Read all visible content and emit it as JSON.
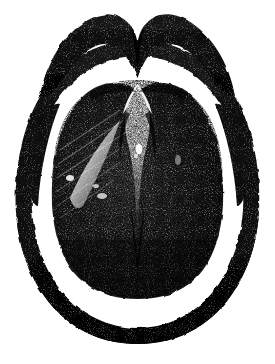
{
  "figure": {
    "kind": "anatomical-engraving",
    "medium": "wood-engraving halftone",
    "alt_text": "Black and white antique engraving of a rounded oval anatomical cross-section with a wavy dark band across the top, a dark outer rim, and a large stippled inner mass split by a central V-shaped groove.",
    "background_color": "#ffffff",
    "ink_color": "#0d0d0d",
    "midtone_color": "#3a3a3a",
    "highlight_color": "#f2f2f2",
    "width_px": 275,
    "height_px": 364
  },
  "parts": [
    {
      "id": "upper-band",
      "label": "Upper wavy band",
      "description": "Dark M-shaped band arching across the top with a central dip and tapering ends.",
      "tone": "dark",
      "bbox": [
        36,
        8,
        240,
        96
      ]
    },
    {
      "id": "outer-rim",
      "label": "Outer rim",
      "description": "Dark oval ring enclosing the figure, thickest along the lower left and lower right.",
      "tone": "dark",
      "bbox": [
        14,
        40,
        262,
        338
      ]
    },
    {
      "id": "left-spur",
      "label": "Left inner spur",
      "description": "Thin tapering sliver inside the left rim, pointed at the upper end.",
      "tone": "dark",
      "bbox": [
        22,
        100,
        66,
        220
      ]
    },
    {
      "id": "right-spur",
      "label": "Right inner spur",
      "description": "Thin tapering sliver inside the right rim, pointed at the upper end, mirroring the left spur.",
      "tone": "dark",
      "bbox": [
        210,
        100,
        254,
        220
      ]
    },
    {
      "id": "inner-mass",
      "label": "Inner mass",
      "description": "Large stippled body with two rounded upper lobes and a rounded lower margin.",
      "tone": "stipple-dark",
      "bbox": [
        52,
        80,
        224,
        298
      ]
    },
    {
      "id": "median-groove",
      "label": "Median V groove",
      "description": "Pale wedge-shaped cleft descending from between the two upper lobes toward the centre.",
      "tone": "light",
      "bbox": [
        118,
        86,
        158,
        240
      ]
    },
    {
      "id": "left-highlight",
      "label": "Left highlight streak",
      "description": "Diagonal pale streak of burnishing on the left flank of the inner mass.",
      "tone": "highlight",
      "bbox": [
        68,
        130,
        120,
        206
      ]
    },
    {
      "id": "central-highlight",
      "label": "Central highlight speck",
      "description": "Small bright speck near the upper middle of the median groove.",
      "tone": "highlight",
      "bbox": [
        134,
        142,
        146,
        158
      ]
    }
  ],
  "annotations": {
    "visible_text": [],
    "labels_present": false,
    "caption_present": false
  }
}
